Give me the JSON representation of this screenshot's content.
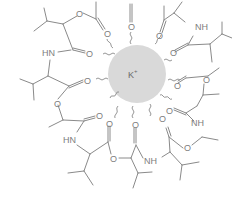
{
  "figure": {
    "center_ion": {
      "label": "K+",
      "symbol": "K",
      "charge": "+",
      "fill": "#d9d9d9"
    },
    "colors": {
      "bond": "#8a8a8a",
      "text": "#7d7d7d",
      "background": "#ffffff"
    },
    "atom_labels": {
      "oxygen": "O",
      "amide": "NH",
      "amide_left": "HN"
    },
    "labels": [
      {
        "id": "o_top_left_ester",
        "text": "O"
      },
      {
        "id": "o_top_left_carbonyl",
        "text": "O"
      },
      {
        "id": "hn_left_upper",
        "text": "HN"
      },
      {
        "id": "o_left_upper_carbonyl",
        "text": "O"
      },
      {
        "id": "o_left_carbonyl",
        "text": "O"
      },
      {
        "id": "o_left_ester",
        "text": "O"
      },
      {
        "id": "o_left_lower_carbonyl",
        "text": "O"
      },
      {
        "id": "hn_left_lower",
        "text": "HN"
      },
      {
        "id": "o_bottom_left_carbonyl",
        "text": "O"
      },
      {
        "id": "o_bottom_ester",
        "text": "O"
      },
      {
        "id": "o_bottom_carbonyl",
        "text": "O"
      },
      {
        "id": "nh_bottom",
        "text": "NH"
      },
      {
        "id": "o_bottom_right_carbonyl",
        "text": "O"
      },
      {
        "id": "o_bottom_right_ester",
        "text": "O"
      },
      {
        "id": "nh_right_lower",
        "text": "NH"
      },
      {
        "id": "o_right_lower_carbonyl",
        "text": "O"
      },
      {
        "id": "o_right_carbonyl",
        "text": "O"
      },
      {
        "id": "o_right_ester",
        "text": "O"
      },
      {
        "id": "o_right_upper_carbonyl",
        "text": "O"
      },
      {
        "id": "nh_right_upper",
        "text": "NH"
      },
      {
        "id": "o_top_right_carbonyl",
        "text": "O"
      },
      {
        "id": "o_top_carbonyl",
        "text": "O"
      }
    ]
  }
}
